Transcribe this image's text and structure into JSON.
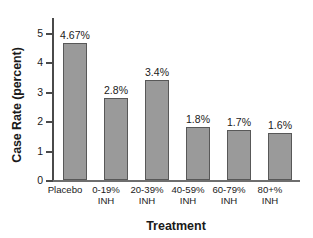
{
  "chart_data": {
    "type": "bar",
    "title": "",
    "xlabel": "Treatment",
    "ylabel": "Case Rate (percent)",
    "categories": [
      "Placebo",
      "0-19%\nINH",
      "20-39%\nINH",
      "40-59%\nINH",
      "60-79%\nINH",
      "80+%\nINH"
    ],
    "values": [
      4.67,
      2.8,
      3.4,
      1.8,
      1.7,
      1.6
    ],
    "data_labels": [
      "4.67%",
      "2.8%",
      "3.4%",
      "1.8%",
      "1.7%",
      "1.6%"
    ],
    "ylim": [
      0,
      5
    ],
    "yticks": [
      0,
      1,
      2,
      3,
      4,
      5
    ],
    "ytick_labels": [
      "0",
      "1",
      "2",
      "3",
      "4",
      "5"
    ],
    "grid": false,
    "legend": false,
    "bar_fill_color": "#9a9a9a",
    "bar_edge_color": "#585858",
    "axis_color": "#4a4a4a"
  }
}
